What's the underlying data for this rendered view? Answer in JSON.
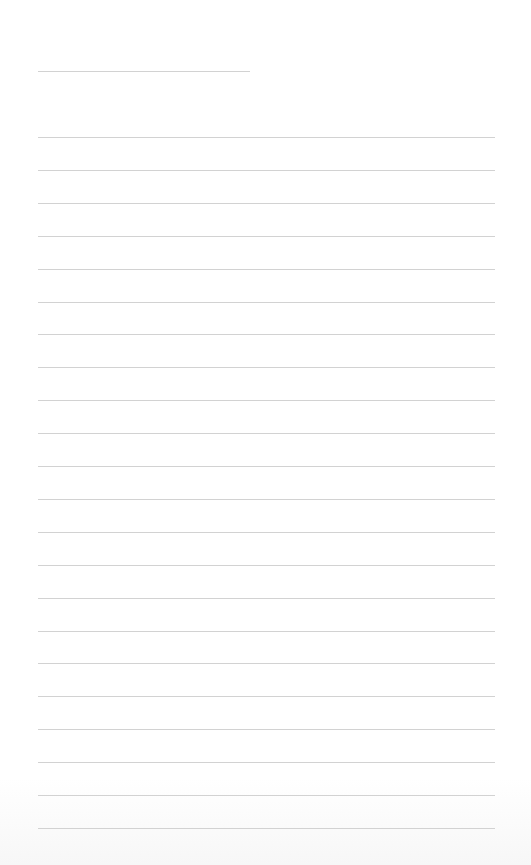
{
  "document": {
    "type": "blank lined writing page",
    "title_line": {
      "x": 38,
      "y": 71,
      "width": 212
    },
    "ruled_lines": {
      "count": 22,
      "start_y": 137,
      "spacing": 32.9,
      "x": 38,
      "width": 457
    },
    "colors": {
      "background": "#ffffff",
      "line": "#d2d2d2"
    }
  }
}
